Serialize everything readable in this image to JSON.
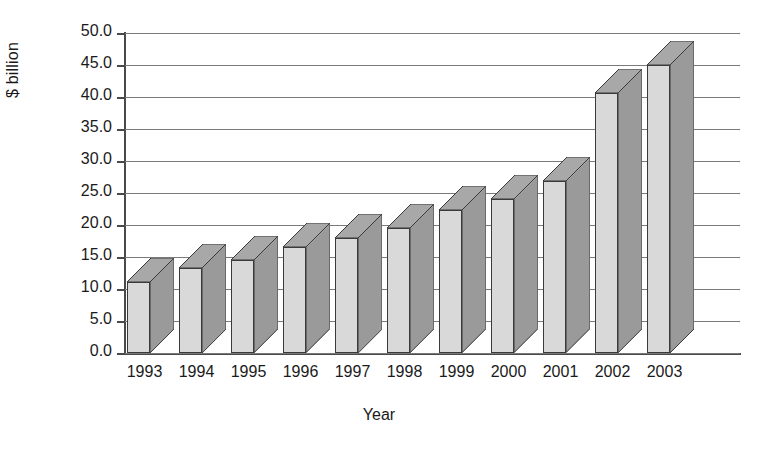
{
  "chart_data": {
    "type": "bar",
    "title": "",
    "xlabel": "Year",
    "ylabel": "$ billion",
    "categories": [
      "1993",
      "1994",
      "1995",
      "1996",
      "1997",
      "1998",
      "1999",
      "2000",
      "2001",
      "2002",
      "2003"
    ],
    "values": [
      11.1,
      13.3,
      14.5,
      16.5,
      18.0,
      19.5,
      22.3,
      24.0,
      26.8,
      40.6,
      45.0
    ],
    "ylim": [
      0,
      50
    ],
    "ytick_step": 5,
    "ytick_labels": [
      "0.0",
      "5.0",
      "10.0",
      "15.0",
      "20.0",
      "25.0",
      "30.0",
      "35.0",
      "40.0",
      "45.0",
      "50.0"
    ],
    "grid": true,
    "legend": "none",
    "style": "3d-column",
    "colors": {
      "bar_front": "#d9d9d9",
      "bar_side": "#9a9a9a",
      "bar_top": "#a8a8a8",
      "bar_outline": "#3a3a3a",
      "gridline": "#7a7a7a",
      "axis": "#4a4a4a",
      "text": "#1a1a1a",
      "background": "#ffffff"
    }
  }
}
